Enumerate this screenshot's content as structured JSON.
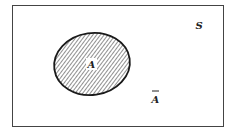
{
  "diagram": {
    "type": "venn",
    "universe_label": "S",
    "set_label": "A",
    "complement_label": "A",
    "complement_bar": true,
    "set_fill": "hatched",
    "colors": {
      "stroke": "#222222",
      "background": "#ffffff"
    }
  }
}
